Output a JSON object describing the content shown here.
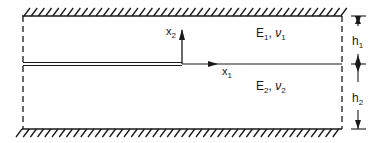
{
  "diagram": {
    "type": "bimaterial-strip-crack",
    "colors": {
      "line": "#1a1a1a",
      "background": "#ffffff"
    },
    "labels": {
      "x1_base": "x",
      "x1_sub": "1",
      "x2_base": "x",
      "x2_sub": "2",
      "material_top_E": "E",
      "material_top_E_sub": "1",
      "material_top_sep": ", ",
      "material_top_nu": "ν",
      "material_top_nu_sub": "1",
      "material_bottom_E": "E",
      "material_bottom_E_sub": "2",
      "material_bottom_sep": ", ",
      "material_bottom_nu": "ν",
      "material_bottom_nu_sub": "2",
      "h1_base": "h",
      "h1_sub": "1",
      "h2_base": "h",
      "h2_sub": "2"
    },
    "elements": [
      "top-rigid-wall (hatched)",
      "bottom-rigid-wall (hatched)",
      "left-dashed-boundary",
      "right-dashed-boundary",
      "interface-crack (double line, left half)",
      "bonded-interface (single line, right half)",
      "x1-axis-arrow",
      "x2-axis-arrow",
      "thickness-dimension h1",
      "thickness-dimension h2"
    ]
  }
}
